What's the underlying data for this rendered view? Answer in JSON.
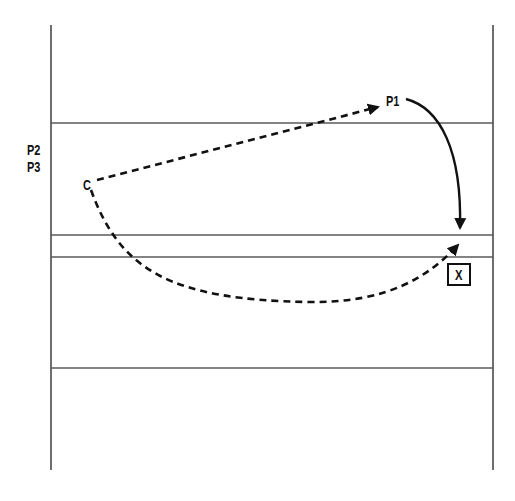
{
  "diagram": {
    "type": "flow-path-diagram",
    "colors": {
      "line": "#4a4a4a",
      "ink": "#111111",
      "background": "#ffffff"
    },
    "frame": {
      "left_x": 51,
      "right_x": 493,
      "top_y": 25,
      "bottom_y": 470,
      "horizontal_lines_y": [
        123,
        235,
        257,
        368
      ]
    },
    "labels": {
      "p2": "P2",
      "p3": "P3",
      "c": "C",
      "p1": "P1",
      "x": "X"
    },
    "paths": [
      {
        "name": "c-to-p1",
        "style": "dashed",
        "arrow": "end",
        "from": "C",
        "to": "P1"
      },
      {
        "name": "p1-to-target",
        "style": "solid",
        "arrow": "end",
        "from": "P1",
        "to": "target"
      },
      {
        "name": "c-to-target",
        "style": "dashed",
        "arrow": "end",
        "from": "C",
        "to": "target"
      }
    ]
  }
}
